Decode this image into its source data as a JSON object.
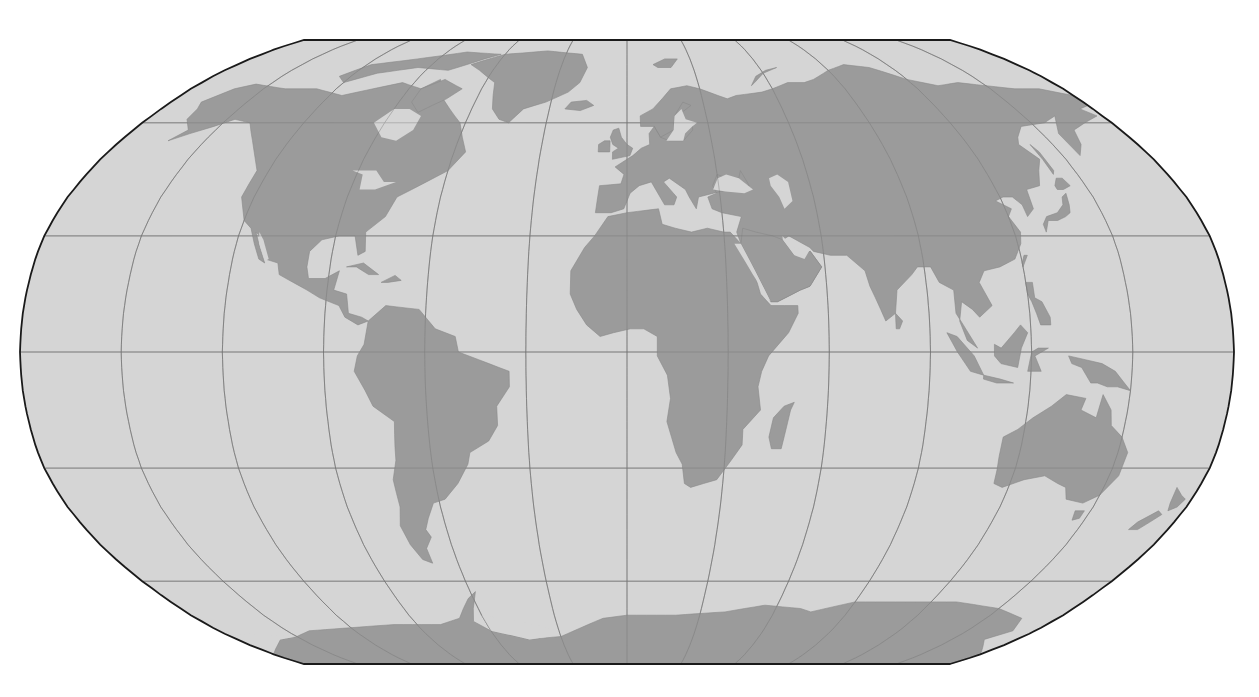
{
  "map": {
    "projection": "Robinson",
    "colors": {
      "ocean": "#d5d5d5",
      "land": "#9b9b9b",
      "graticule": "#6e6e6e",
      "frame": "#1a1a1a",
      "background": "#ffffff"
    },
    "graticule": {
      "meridian_step_deg": 30,
      "parallel_step_deg": 30
    },
    "layers": [
      "ocean",
      "graticule",
      "land",
      "frame"
    ],
    "continents": [
      "North America",
      "Greenland",
      "South America",
      "Europe",
      "Africa",
      "Asia",
      "Australia",
      "Antarctica"
    ]
  }
}
